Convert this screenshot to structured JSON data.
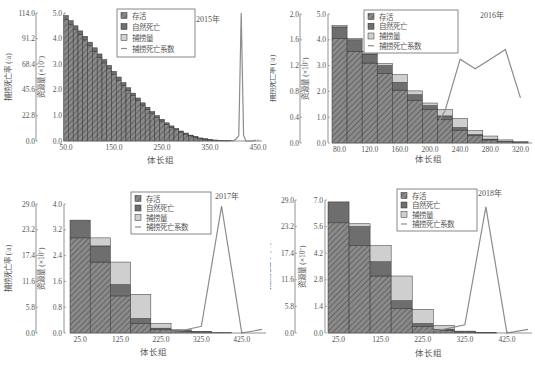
{
  "colors": {
    "survival": "#8a8a8a",
    "survival_hatch": "#5a5a5a",
    "natural_death": "#6e6e6e",
    "catch": "#cfcfcf",
    "f_line": "#8c8c8c",
    "axis": "#777777",
    "text": "#555555"
  },
  "legend": {
    "survival": "存活",
    "natural_death": "自然死亡",
    "catch": "捕捞量",
    "fishing_mortality": "捕捞死亡系数"
  },
  "chart_data": [
    {
      "type": "bar",
      "stacked": true,
      "title": "2015年",
      "xlabel": "体长组",
      "ylabel": "资源量 (×10⁷)",
      "ylabel2": "捕捞死亡率 (/a)",
      "ylim": [
        0,
        5.0
      ],
      "y2lim": [
        0,
        114.0
      ],
      "yticks": [
        "0.0",
        "1.0",
        "2.0",
        "3.0",
        "4.0",
        "5.0"
      ],
      "y2ticks": [
        "0.0",
        "22.8",
        "45.6",
        "68.4",
        "91.2",
        "114.0"
      ],
      "xlim": [
        50,
        450
      ],
      "xticks": [
        "50.0",
        "150.0",
        "250.0",
        "350.0",
        "450.0"
      ],
      "bin_width": 10,
      "x": [
        50,
        60,
        70,
        80,
        90,
        100,
        110,
        120,
        130,
        140,
        150,
        160,
        170,
        180,
        190,
        200,
        210,
        220,
        230,
        240,
        250,
        260,
        270,
        280,
        290,
        300,
        310,
        320,
        330,
        340,
        350,
        360,
        370,
        380,
        390
      ],
      "series": [
        {
          "name": "存活",
          "values": [
            4.75,
            4.55,
            4.35,
            4.15,
            3.95,
            3.72,
            3.5,
            3.27,
            3.05,
            2.82,
            2.6,
            2.38,
            2.17,
            1.97,
            1.77,
            1.58,
            1.4,
            1.23,
            1.07,
            0.92,
            0.78,
            0.65,
            0.54,
            0.44,
            0.35,
            0.27,
            0.2,
            0.15,
            0.1,
            0.07,
            0.04,
            0.03,
            0.02,
            0.01,
            0.01
          ]
        },
        {
          "name": "自然死亡",
          "values": [
            0.15,
            0.15,
            0.15,
            0.15,
            0.14,
            0.14,
            0.14,
            0.13,
            0.13,
            0.13,
            0.12,
            0.12,
            0.11,
            0.11,
            0.1,
            0.1,
            0.09,
            0.09,
            0.08,
            0.07,
            0.07,
            0.06,
            0.05,
            0.05,
            0.04,
            0.04,
            0.03,
            0.03,
            0.02,
            0.02,
            0.01,
            0.01,
            0.01,
            0.0,
            0.0
          ]
        },
        {
          "name": "捕捞量",
          "values": [
            0,
            0,
            0,
            0,
            0,
            0,
            0,
            0,
            0,
            0,
            0,
            0,
            0,
            0,
            0,
            0,
            0,
            0,
            0,
            0,
            0,
            0,
            0,
            0,
            0,
            0,
            0,
            0,
            0,
            0,
            0,
            0,
            0,
            0,
            0
          ]
        }
      ],
      "line": {
        "name": "捕捞死亡系数",
        "x": [
          395,
          400,
          405,
          410,
          415,
          420,
          425,
          430,
          440,
          445
        ],
        "values": [
          0,
          0.5,
          2,
          5,
          114,
          5,
          0,
          0,
          0,
          1
        ]
      }
    },
    {
      "type": "bar",
      "stacked": true,
      "title": "2016年",
      "xlabel": "体长组",
      "ylabel": "资源量 (×10⁷)",
      "ylabel2": "捕捞死亡率 (/a)",
      "ylim": [
        0,
        5.0
      ],
      "y2lim": [
        0,
        2.0
      ],
      "yticks": [
        "0.0",
        "1.0",
        "2.0",
        "3.0",
        "4.0",
        "5.0"
      ],
      "y2ticks": [
        "0.0",
        "0.4",
        "0.8",
        "1.2",
        "1.6",
        "2.0"
      ],
      "xlim": [
        70,
        330
      ],
      "xticks": [
        "80.0",
        "120.0",
        "160.0",
        "200.0",
        "240.0",
        "280.0",
        "320.0"
      ],
      "bin_width": 20,
      "x": [
        80,
        100,
        120,
        140,
        160,
        180,
        200,
        220,
        240,
        260,
        280,
        300,
        320
      ],
      "series": [
        {
          "name": "存活",
          "values": [
            4.05,
            3.55,
            3.1,
            2.7,
            2.05,
            1.65,
            1.3,
            0.9,
            0.5,
            0.28,
            0.12,
            0.05,
            0.02
          ]
        },
        {
          "name": "自然死亡",
          "values": [
            0.45,
            0.45,
            0.35,
            0.3,
            0.3,
            0.22,
            0.15,
            0.15,
            0.1,
            0.05,
            0.03,
            0.02,
            0.01
          ]
        },
        {
          "name": "捕捞量",
          "values": [
            0.05,
            0.05,
            0.1,
            0.08,
            0.3,
            0.15,
            0.1,
            0.25,
            0.35,
            0.15,
            0.12,
            0.05,
            0.02
          ]
        }
      ],
      "line": {
        "name": "捕捞死亡系数",
        "x": [
          210,
          220,
          240,
          260,
          280,
          300,
          320
        ],
        "values": [
          0.3,
          0.5,
          1.3,
          1.15,
          1.3,
          1.45,
          0.7
        ]
      }
    },
    {
      "type": "bar",
      "stacked": true,
      "title": "2017年",
      "xlabel": "体长组",
      "ylabel": "资源量 (×10⁷)",
      "ylabel2": "捕捞死亡率 (/a)",
      "ylim": [
        0,
        4.0
      ],
      "y2lim": [
        0,
        29.0
      ],
      "yticks": [
        "0.0",
        "0.8",
        "1.6",
        "2.4",
        "3.2",
        "4.0"
      ],
      "y2ticks": [
        "0.0",
        "5.8",
        "11.6",
        "17.4",
        "23.2",
        "29.0"
      ],
      "xlim": [
        0,
        475
      ],
      "xticks": [
        "25.0",
        "125.0",
        "225.0",
        "325.0",
        "425.0"
      ],
      "bin_width": 50,
      "x": [
        25,
        75,
        125,
        175,
        225,
        275,
        325,
        375
      ],
      "series": [
        {
          "name": "存活",
          "values": [
            2.95,
            2.2,
            1.15,
            0.3,
            0.1,
            0.05,
            0.03,
            0.01
          ]
        },
        {
          "name": "自然死亡",
          "values": [
            0.55,
            0.5,
            0.35,
            0.15,
            0.05,
            0.03,
            0.01,
            0.0
          ]
        },
        {
          "name": "捕捞量",
          "values": [
            0.0,
            0.25,
            0.7,
            0.75,
            0.15,
            0.02,
            0.01,
            0.0
          ]
        }
      ],
      "line": {
        "name": "捕捞死亡系数",
        "x": [
          225,
          275,
          325,
          375,
          425,
          475
        ],
        "values": [
          0.2,
          0.5,
          1.5,
          28.5,
          0,
          0.8
        ]
      }
    },
    {
      "type": "bar",
      "stacked": true,
      "title": "2018年",
      "xlabel": "体长组",
      "ylabel": "资源量 (×10⁷)",
      "ylabel2": "捕捞死亡率 (/a)",
      "ylim": [
        0,
        7.0
      ],
      "y2lim": [
        0,
        29.0
      ],
      "yticks": [
        "0.0",
        "1.4",
        "2.8",
        "4.2",
        "5.6",
        "7.0"
      ],
      "y2ticks": [
        "0.0",
        "5.8",
        "11.6",
        "17.4",
        "23.2",
        "29.0"
      ],
      "xlim": [
        0,
        475
      ],
      "xticks": [
        "25.0",
        "125.0",
        "225.0",
        "325.0",
        "425.0"
      ],
      "bin_width": 50,
      "x": [
        25,
        75,
        125,
        175,
        225,
        275,
        325,
        375
      ],
      "series": [
        {
          "name": "存活",
          "values": [
            5.8,
            4.6,
            3.0,
            1.3,
            0.35,
            0.15,
            0.05,
            0.01
          ]
        },
        {
          "name": "自然死亡",
          "values": [
            1.1,
            1.0,
            0.75,
            0.4,
            0.15,
            0.05,
            0.03,
            0.01
          ]
        },
        {
          "name": "捕捞量",
          "values": [
            0.0,
            0.15,
            0.85,
            1.3,
            0.75,
            0.2,
            0.02,
            0.0
          ]
        }
      ],
      "line": {
        "name": "捕捞死亡系数",
        "x": [
          225,
          275,
          325,
          375,
          425,
          475
        ],
        "values": [
          0.3,
          0.8,
          1.8,
          27.5,
          0,
          0.8
        ]
      }
    }
  ]
}
